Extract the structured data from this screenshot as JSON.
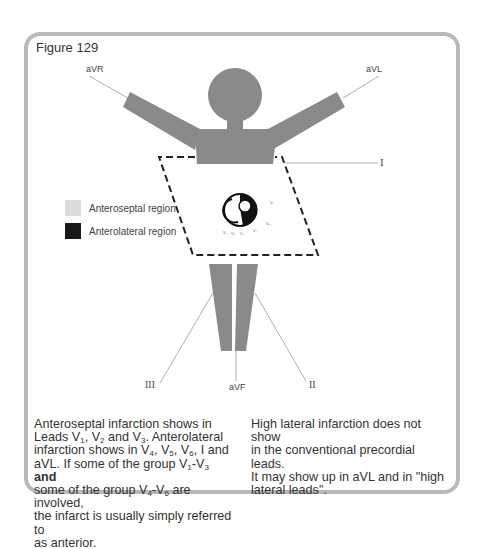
{
  "figure": {
    "title": "Figure 129",
    "colors": {
      "frame": "#b9b9b9",
      "body": "#8a8a8a",
      "anteroseptal": "#dcdcdc",
      "anterolateral": "#1a1a1a",
      "lead_line": "#b0b0b0"
    },
    "leads": {
      "aVR": "aVR",
      "aVL": "aVL",
      "I": "I",
      "II": "II",
      "III": "III",
      "aVF": "aVF"
    },
    "legend": [
      {
        "label": "Anteroseptal region",
        "color": "#dcdcdc"
      },
      {
        "label": "Anterolateral region",
        "color": "#1a1a1a"
      }
    ],
    "precordial_labels": [
      "V1",
      "V2",
      "V3",
      "V4",
      "V5",
      "V6"
    ]
  },
  "text": {
    "left": {
      "p1": "Anteroseptal infarction shows in",
      "p2": "Leads V",
      "p3": "1",
      "p4": ", V",
      "p5": "2",
      "p6": " and V",
      "p7": "3",
      "p8": ". Anterolateral",
      "p9": "infarction shows in V",
      "p10": "4",
      "p11": ", V",
      "p12": "5",
      "p13": ", V",
      "p14": "6",
      "p15": ", I and",
      "p16": "aVL. If some of the group V",
      "p17": "1",
      "p18": "-V",
      "p19": "3",
      "p20": "and",
      "p21": "some of the group V",
      "p22": "4",
      "p23": "-V",
      "p24": "6",
      "p25": " are involved,",
      "p26": "the infarct is usually simply referred to",
      "p27": "as anterior."
    },
    "right": {
      "l1": "High lateral infarction does not show",
      "l2": "in the conventional precordial leads.",
      "l3": "It may show up in aVL and in \"high",
      "l4": "lateral leads\"."
    }
  }
}
